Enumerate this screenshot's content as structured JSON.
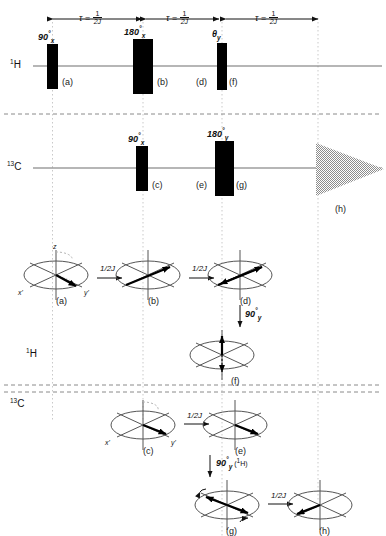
{
  "figure": {
    "channels": [
      {
        "id": "h1",
        "label_html": "1H",
        "nucleus": "H",
        "mass": "1"
      },
      {
        "id": "c13",
        "label_html": "13C",
        "nucleus": "C",
        "mass": "13"
      }
    ],
    "channel_label_h": "H",
    "channel_mass_h": "1",
    "channel_label_c": "C",
    "channel_mass_c": "13",
    "vector_section_label_h_mass": "1",
    "vector_section_label_h": "H",
    "vector_section_label_c_mass": "13",
    "vector_section_label_c": "C"
  },
  "timeline": {
    "intervals": [
      {
        "id": "tau1",
        "symbol": "τ",
        "equals": "=",
        "numerator": "1",
        "denominator": "2J"
      },
      {
        "id": "tau2",
        "symbol": "τ",
        "equals": "=",
        "numerator": "1",
        "denominator": "2J"
      },
      {
        "id": "tau3",
        "symbol": "τ",
        "equals": "=",
        "numerator": "1",
        "denominator": "2J"
      }
    ]
  },
  "pulses": {
    "h1": [
      {
        "id": "p-a",
        "angle": "90",
        "degree": "°",
        "phase": "x",
        "tag": "(a)"
      },
      {
        "id": "p-b",
        "angle": "180",
        "degree": "°",
        "phase": "x",
        "tag": "(b)"
      },
      {
        "id": "p-df",
        "angle": "θ",
        "degree": "",
        "phase": "y",
        "tag_left": "(d)",
        "tag_right": "(f)"
      }
    ],
    "c13": [
      {
        "id": "p-c",
        "angle": "90",
        "degree": "°",
        "phase": "x",
        "tag": "(c)"
      },
      {
        "id": "p-eg",
        "angle": "180",
        "degree": "°",
        "phase": "y",
        "tag_left": "(e)",
        "tag_right": "(g)"
      }
    ],
    "acquisition": {
      "id": "p-h",
      "tag": "(h)",
      "type": "fid-decay"
    }
  },
  "vectors": {
    "h1_row": [
      {
        "id": "v-a",
        "tag": "(a)",
        "axis_z": "z",
        "axis_x": "x'",
        "axis_y": "y'"
      },
      {
        "id": "v-b",
        "tag": "(b)"
      },
      {
        "id": "v-d",
        "tag": "(d)"
      },
      {
        "id": "v-f",
        "tag": "(f)"
      }
    ],
    "c13_row": [
      {
        "id": "v-c",
        "tag": "(c)",
        "axis_x": "x'",
        "axis_y": "y'"
      },
      {
        "id": "v-e",
        "tag": "(e)"
      },
      {
        "id": "v-g",
        "tag": "(g)"
      },
      {
        "id": "v-h",
        "tag": "(h)"
      }
    ],
    "transition_labels": {
      "ab": "1/2J",
      "bd": "1/2J",
      "df": {
        "angle": "90",
        "degree": "°",
        "phase": "y"
      },
      "ce": "1/2J",
      "eg": {
        "angle": "90",
        "degree": "°",
        "phase": "y",
        "note": "(1H)",
        "note_mass": "1",
        "note_nucleus": "H"
      },
      "gh": "1/2J"
    }
  },
  "colors": {
    "ink": "#111111",
    "pulse_fill": "#000000",
    "axis_line": "#6f6f6f",
    "guide_dotted": "#bdbdbd",
    "separator_dashed": "#8a8a8a",
    "fid": "#8d8d8d"
  }
}
